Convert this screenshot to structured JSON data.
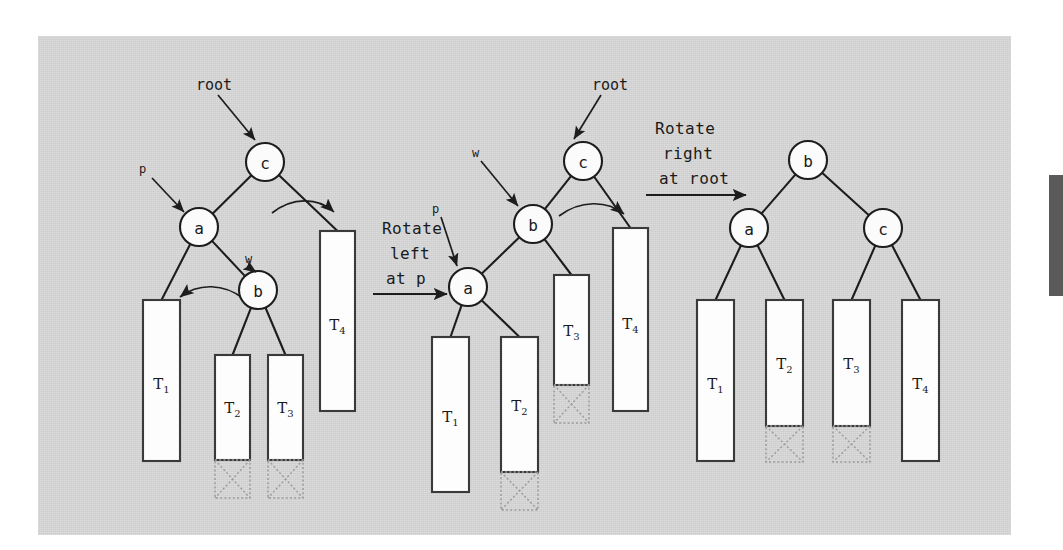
{
  "figure": {
    "kind": "binary-tree-rotation-diagram",
    "background_color": "#d4d4d4",
    "page_color": "#ffffff",
    "ink_color": "#1a1a1a",
    "edge_marker_color": "#5a5a5a"
  },
  "trees": [
    {
      "id": "before",
      "name": "before-rotation-tree",
      "nodes": [
        {
          "key": "c",
          "x": 265,
          "y": 162,
          "r": 19
        },
        {
          "key": "a",
          "x": 199,
          "y": 227,
          "r": 19
        },
        {
          "key": "b",
          "x": 258,
          "y": 290,
          "r": 19
        }
      ],
      "pointers": [
        {
          "label": "root",
          "lx": 196,
          "ly": 85,
          "ax0": 218,
          "ay0": 95,
          "ax1": 255,
          "ay1": 140
        },
        {
          "label": "p",
          "lx": 139,
          "ly": 168,
          "ax0": 152,
          "ay0": 178,
          "ax1": 184,
          "ay1": 212
        },
        {
          "label": "w",
          "lx": 245,
          "ly": 258,
          "ax0": 247,
          "ay0": 266,
          "ax1": 256,
          "ay1": 272
        }
      ],
      "subtrees": [
        {
          "label": "T",
          "sub": "1",
          "x": 143,
          "y": 300,
          "w": 37,
          "h": 161,
          "ext": 0
        },
        {
          "label": "T",
          "sub": "2",
          "x": 215,
          "y": 355,
          "w": 35,
          "h": 105,
          "ext": 38
        },
        {
          "label": "T",
          "sub": "3",
          "x": 268,
          "y": 355,
          "w": 35,
          "h": 105,
          "ext": 38
        },
        {
          "label": "T",
          "sub": "4",
          "x": 320,
          "y": 231,
          "w": 35,
          "h": 180,
          "ext": 0
        }
      ]
    },
    {
      "id": "middle",
      "name": "after-left-rotation-tree",
      "nodes": [
        {
          "key": "c",
          "x": 583,
          "y": 161,
          "r": 19
        },
        {
          "key": "b",
          "x": 533,
          "y": 224,
          "r": 19
        },
        {
          "key": "a",
          "x": 468,
          "y": 287,
          "r": 19
        }
      ],
      "pointers": [
        {
          "label": "root",
          "lx": 592,
          "ly": 85,
          "ax0": 601,
          "ay0": 95,
          "ax1": 574,
          "ay1": 139
        },
        {
          "label": "w",
          "lx": 472,
          "ly": 152,
          "ax0": 481,
          "ay0": 161,
          "ax1": 518,
          "ay1": 206
        },
        {
          "label": "p",
          "lx": 432,
          "ly": 208,
          "ax0": 441,
          "ay0": 217,
          "ax1": 457,
          "ay1": 266
        }
      ],
      "subtrees": [
        {
          "label": "T",
          "sub": "1",
          "x": 432,
          "y": 337,
          "w": 37,
          "h": 155,
          "ext": 0
        },
        {
          "label": "T",
          "sub": "2",
          "x": 501,
          "y": 337,
          "w": 37,
          "h": 135,
          "ext": 38
        },
        {
          "label": "T",
          "sub": "3",
          "x": 554,
          "y": 275,
          "w": 35,
          "h": 110,
          "ext": 38
        },
        {
          "label": "T",
          "sub": "4",
          "x": 613,
          "y": 228,
          "w": 35,
          "h": 183,
          "ext": 0
        }
      ]
    },
    {
      "id": "after",
      "name": "after-right-rotation-tree",
      "nodes": [
        {
          "key": "b",
          "x": 808,
          "y": 160,
          "r": 19
        },
        {
          "key": "a",
          "x": 749,
          "y": 228,
          "r": 19
        },
        {
          "key": "c",
          "x": 883,
          "y": 228,
          "r": 19
        }
      ],
      "pointers": [],
      "subtrees": [
        {
          "label": "T",
          "sub": "1",
          "x": 697,
          "y": 300,
          "w": 37,
          "h": 161,
          "ext": 0
        },
        {
          "label": "T",
          "sub": "2",
          "x": 766,
          "y": 300,
          "w": 37,
          "h": 126,
          "ext": 36
        },
        {
          "label": "T",
          "sub": "3",
          "x": 833,
          "y": 300,
          "w": 37,
          "h": 126,
          "ext": 36
        },
        {
          "label": "T",
          "sub": "4",
          "x": 902,
          "y": 300,
          "w": 37,
          "h": 161,
          "ext": 0
        }
      ]
    }
  ],
  "operations": [
    {
      "id": "op-left",
      "name": "rotate-left-at-p",
      "lines": [
        "Rotate",
        "left",
        "at p"
      ],
      "text_x": 382,
      "text_y": 234,
      "arrow_x0": 373,
      "arrow_x1": 449,
      "arrow_y": 294
    },
    {
      "id": "op-right",
      "name": "rotate-right-at-root",
      "lines": [
        "Rotate",
        "right",
        "at root"
      ],
      "text_x": 655,
      "text_y": 134,
      "arrow_x0": 646,
      "arrow_x1": 748,
      "arrow_y": 195
    }
  ],
  "curved_hints": [
    {
      "name": "left-tree-curve-c-to-right",
      "d": "M 268 212 C 290 196, 316 196, 333 212",
      "tip": [
        333,
        212
      ]
    },
    {
      "name": "left-tree-curve-a-to-left",
      "d": "M 242 296 C 222 280, 196 280, 176 296",
      "tip": [
        176,
        296
      ]
    },
    {
      "name": "middle-tree-curve-b-to-right",
      "d": "M 556 218 C 576 202, 604 202, 622 218",
      "tip": [
        622,
        218
      ]
    }
  ]
}
